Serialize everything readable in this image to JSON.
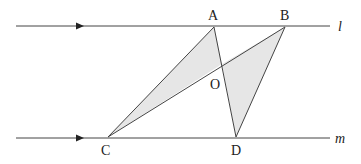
{
  "diagram": {
    "lines": [
      {
        "name": "l",
        "label": "l"
      },
      {
        "name": "m",
        "label": "m"
      }
    ],
    "points": {
      "A": "A",
      "B": "B",
      "C": "C",
      "D": "D",
      "O": "O"
    },
    "shaded_triangles": [
      [
        "A",
        "C",
        "O"
      ],
      [
        "B",
        "D",
        "O"
      ]
    ],
    "fill_color": "#e6e6e6",
    "stroke_color": "#444444"
  }
}
